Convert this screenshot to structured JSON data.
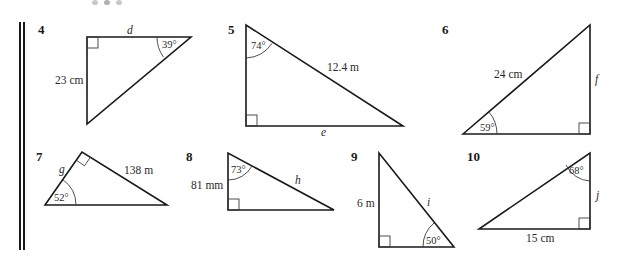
{
  "problems": [
    {
      "number": "4",
      "labels": {
        "side_top": "d",
        "angle": "39°",
        "side_left": "23 cm"
      }
    },
    {
      "number": "5",
      "labels": {
        "angle": "74°",
        "hypotenuse": "12.4 m",
        "side_bottom": "e"
      }
    },
    {
      "number": "6",
      "labels": {
        "hypotenuse": "24 cm",
        "side_right": "f",
        "angle": "59°"
      }
    },
    {
      "number": "7",
      "labels": {
        "side_left": "g",
        "side_right": "138 m",
        "angle": "52°"
      }
    },
    {
      "number": "8",
      "labels": {
        "angle": "73°",
        "side_left": "81 mm",
        "hypotenuse": "h"
      }
    },
    {
      "number": "9",
      "labels": {
        "side_left": "6 m",
        "hypotenuse": "i",
        "angle": "50°"
      }
    },
    {
      "number": "10",
      "labels": {
        "angle": "68°",
        "side_right": "j",
        "side_bottom": "15 cm"
      }
    }
  ],
  "colors": {
    "line": "#1a1a1a",
    "text": "#2a2a2a",
    "margin_dots": "#c8c8c8"
  }
}
